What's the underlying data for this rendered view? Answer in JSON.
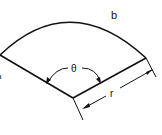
{
  "diagram": {
    "labels": {
      "arc": "b",
      "angle": "θ",
      "radius": "r",
      "left_point": "a"
    },
    "stroke_color": "#111111",
    "background_color": "#ffffff"
  }
}
